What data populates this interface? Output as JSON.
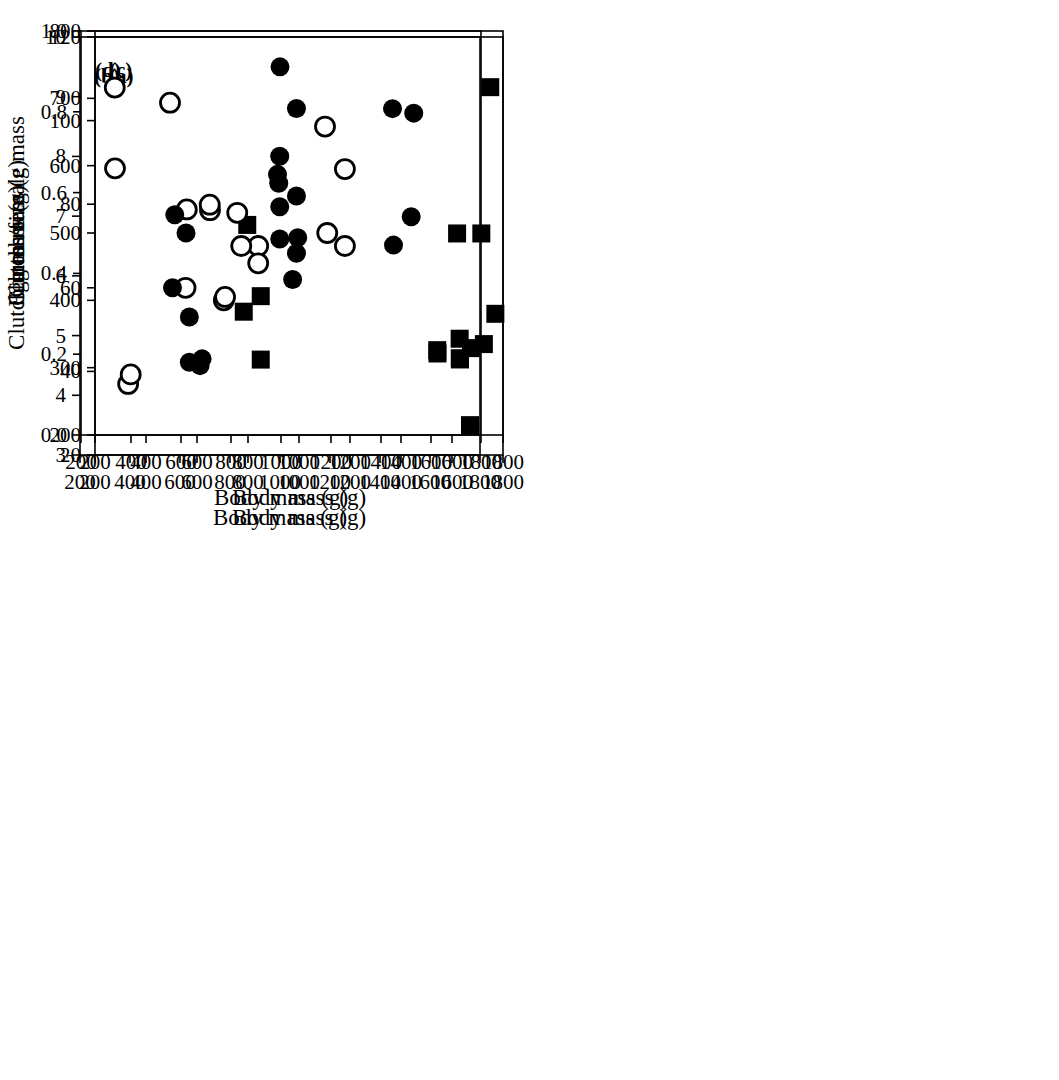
{
  "figure": {
    "background_color": "#ffffff",
    "marker_color": "#000000",
    "panel_labels": [
      "(a)",
      "(b)",
      "(c)",
      "(d)"
    ]
  },
  "chart_data": [
    {
      "type": "scatter",
      "panel_label": "(a)",
      "xlabel": "Body mass (g)",
      "ylabel": "Egg mass (g)",
      "xlim": [
        200,
        1800
      ],
      "xticks": [
        200,
        400,
        600,
        800,
        1000,
        1200,
        1400,
        1600,
        1800
      ],
      "xtick_labels": [
        "200",
        "400",
        "600",
        "800",
        "1000",
        "1200",
        "1400",
        "1600",
        "1800"
      ],
      "ylim": [
        20,
        120
      ],
      "yticks": [
        20,
        40,
        60,
        80,
        100,
        120
      ],
      "ytick_labels": [
        "20",
        "40",
        "60",
        "80",
        "100",
        "120"
      ],
      "grid": false,
      "legend": "none",
      "series": [
        {
          "name": "open circles",
          "marker": "circle-open",
          "points": [
            [
              330,
              37
            ],
            [
              555,
              60
            ],
            [
              705,
              57
            ],
            [
              840,
              70
            ],
            [
              1180,
              70
            ]
          ]
        },
        {
          "name": "filled circles",
          "marker": "circle-filled",
          "points": [
            [
              570,
              53
            ],
            [
              620,
              43
            ],
            [
              975,
              62
            ],
            [
              995,
              72
            ],
            [
              1440,
              77
            ]
          ]
        },
        {
          "name": "filled squares",
          "marker": "square-filled",
          "points": [
            [
              850,
              58
            ],
            [
              1620,
              73
            ],
            [
              1715,
              73
            ],
            [
              1750,
              108
            ]
          ]
        }
      ]
    },
    {
      "type": "scatter",
      "panel_label": "(b)",
      "xlabel": "Body mass (g)",
      "ylabel": "Clutch size",
      "xlim": [
        200,
        1800
      ],
      "xticks": [
        200,
        400,
        600,
        800,
        1000,
        1200,
        1400,
        1600,
        1800
      ],
      "xtick_labels": [
        "200",
        "400",
        "600",
        "800",
        "1000",
        "1200",
        "1400",
        "1600",
        "1800"
      ],
      "ylim": [
        3,
        10
      ],
      "yticks": [
        3,
        4,
        5,
        6,
        7,
        8,
        9,
        10
      ],
      "ytick_labels": [
        "3",
        "4",
        "5",
        "6",
        "7",
        "8",
        "9",
        "10"
      ],
      "grid": false,
      "legend": "none",
      "series": [
        {
          "name": "open circles",
          "marker": "circle-open",
          "points": [
            [
              340,
              7.8
            ],
            [
              560,
              8.9
            ],
            [
              720,
              7.1
            ],
            [
              845,
              6.5
            ],
            [
              1180,
              8.5
            ]
          ]
        },
        {
          "name": "filled circles",
          "marker": "circle-filled",
          "points": [
            [
              570,
              5.8
            ],
            [
              625,
              7.1
            ],
            [
              1000,
              9.5
            ],
            [
              990,
              7.7
            ],
            [
              995,
              7.55
            ],
            [
              1450,
              8.8
            ]
          ]
        },
        {
          "name": "filled squares",
          "marker": "square-filled",
          "points": [
            [
              855,
              5.4
            ],
            [
              1630,
              4.7
            ],
            [
              1720,
              4.6
            ],
            [
              1760,
              3.5
            ]
          ]
        }
      ]
    },
    {
      "type": "scatter",
      "panel_label": "(c)",
      "xlabel": "Body mass (g)",
      "ylabel": "Clutch mass (g)",
      "xlim": [
        200,
        1800
      ],
      "xticks": [
        200,
        400,
        600,
        800,
        1000,
        1200,
        1400,
        1600,
        1800
      ],
      "xtick_labels": [
        "200",
        "400",
        "600",
        "800",
        "1000",
        "1200",
        "1400",
        "1600",
        "1800"
      ],
      "ylim": [
        200,
        800
      ],
      "yticks": [
        200,
        300,
        400,
        500,
        600,
        700,
        800
      ],
      "ytick_labels": [
        "200",
        "300",
        "400",
        "500",
        "600",
        "700",
        "800"
      ],
      "grid": false,
      "legend": "none",
      "series": [
        {
          "name": "open circles",
          "marker": "circle-open",
          "points": [
            [
              340,
              290
            ],
            [
              560,
              535
            ],
            [
              710,
              405
            ],
            [
              840,
              455
            ],
            [
              1180,
              595
            ]
          ]
        },
        {
          "name": "filled circles",
          "marker": "circle-filled",
          "points": [
            [
              570,
              308
            ],
            [
              612,
              303
            ],
            [
              990,
              685
            ],
            [
              990,
              555
            ],
            [
              990,
              470
            ],
            [
              1450,
              678
            ]
          ]
        },
        {
          "name": "filled squares",
          "marker": "square-filled",
          "points": [
            [
              850,
              312
            ],
            [
              1630,
              343
            ],
            [
              1725,
              335
            ],
            [
              1770,
              380
            ]
          ]
        }
      ]
    },
    {
      "type": "scatter",
      "panel_label": "(d)",
      "xlabel": "Body mass (g)",
      "ylabel": "Clutch mass/female mass",
      "xlim": [
        200,
        1800
      ],
      "xticks": [
        200,
        400,
        600,
        800,
        1000,
        1200,
        1400,
        1600,
        1800
      ],
      "xtick_labels": [
        "200",
        "400",
        "600",
        "800",
        "1000",
        "1200",
        "1400",
        "1600",
        "1800"
      ],
      "ylim": [
        0.0,
        1.0
      ],
      "yticks": [
        0.0,
        0.2,
        0.4,
        0.6,
        0.8,
        1.0
      ],
      "ytick_labels": [
        "0.0",
        "0.2",
        "0.4",
        "0.6",
        "0.8",
        "1.0"
      ],
      "grid": false,
      "legend": "none",
      "series": [
        {
          "name": "open circles",
          "marker": "circle-open",
          "points": [
            [
              335,
              0.86
            ],
            [
              715,
              0.57
            ],
            [
              825,
              0.55
            ],
            [
              1185,
              0.5
            ]
          ]
        },
        {
          "name": "filled circles",
          "marker": "circle-filled",
          "points": [
            [
              575,
              0.545
            ],
            [
              620,
              0.5
            ],
            [
              995,
              0.69
            ],
            [
              995,
              0.565
            ],
            [
              995,
              0.485
            ],
            [
              1450,
              0.47
            ]
          ]
        },
        {
          "name": "filled squares",
          "marker": "square-filled",
          "points": [
            [
              865,
              0.52
            ],
            [
              1625,
              0.21
            ],
            [
              1715,
              0.19
            ],
            [
              1760,
              0.215
            ]
          ]
        }
      ]
    }
  ]
}
